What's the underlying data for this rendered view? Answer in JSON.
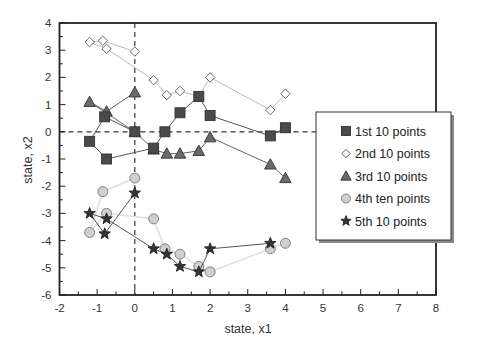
{
  "chart_data": {
    "type": "scatter",
    "title": "",
    "xlabel": "state, x1",
    "ylabel": "state, x2",
    "xlim": [
      -2,
      8
    ],
    "ylim": [
      -6,
      4
    ],
    "xticks": [
      -2,
      -1,
      0,
      1,
      2,
      3,
      4,
      5,
      6,
      7,
      8
    ],
    "yticks": [
      -6,
      -5,
      -4,
      -3,
      -2,
      -1,
      0,
      1,
      2,
      3,
      4
    ],
    "grid": false,
    "reference_lines": {
      "x": 0,
      "y": 0,
      "style": "dashed"
    },
    "legend_position": "right-middle",
    "series": [
      {
        "name": "1st 10 points",
        "marker": "square",
        "color": "#4a4a4a",
        "line_color": "#555555",
        "points": [
          [
            0,
            0
          ],
          [
            -0.8,
            0.55
          ],
          [
            -1.2,
            -0.35
          ],
          [
            -0.75,
            -1.0
          ],
          [
            0.5,
            -0.6
          ],
          [
            0.8,
            0.0
          ],
          [
            1.2,
            0.7
          ],
          [
            1.7,
            1.3
          ],
          [
            2.0,
            0.6
          ],
          [
            3.6,
            -0.15
          ],
          [
            4.0,
            0.15
          ]
        ]
      },
      {
        "name": "2nd 10 points",
        "marker": "diamond",
        "color": "#ffffff",
        "line_color": "#bbbbbb",
        "points": [
          [
            0,
            2.95
          ],
          [
            -0.85,
            3.35
          ],
          [
            -1.2,
            3.3
          ],
          [
            -0.75,
            3.05
          ],
          [
            0.5,
            1.9
          ],
          [
            0.85,
            1.35
          ],
          [
            1.2,
            1.5
          ],
          [
            1.7,
            1.3
          ],
          [
            2.0,
            2.0
          ],
          [
            3.6,
            0.8
          ],
          [
            4.0,
            1.4
          ]
        ]
      },
      {
        "name": "3rd 10 points",
        "marker": "triangle",
        "color": "#6a6a6a",
        "line_color": "#666666",
        "points": [
          [
            0,
            1.45
          ],
          [
            -0.75,
            0.75
          ],
          [
            -1.2,
            1.1
          ],
          [
            0,
            0
          ],
          [
            0.5,
            -0.65
          ],
          [
            0.85,
            -0.8
          ],
          [
            1.2,
            -0.8
          ],
          [
            1.7,
            -0.7
          ],
          [
            2.0,
            -0.2
          ],
          [
            3.6,
            -1.2
          ],
          [
            4.0,
            -1.7
          ]
        ]
      },
      {
        "name": "4th ten points",
        "marker": "circle",
        "color": "#d0d0d0",
        "line_color": "#e0e0e0",
        "points": [
          [
            0,
            -1.7
          ],
          [
            -0.85,
            -2.2
          ],
          [
            -1.2,
            -3.7
          ],
          [
            -0.75,
            -3.0
          ],
          [
            0.5,
            -3.2
          ],
          [
            0.8,
            -4.3
          ],
          [
            1.2,
            -4.5
          ],
          [
            1.7,
            -4.95
          ],
          [
            2.0,
            -5.15
          ],
          [
            3.6,
            -4.3
          ],
          [
            4.0,
            -4.1
          ]
        ]
      },
      {
        "name": "5th 10 points",
        "marker": "star",
        "color": "#333333",
        "line_color": "#555555",
        "points": [
          [
            0,
            -2.25
          ],
          [
            -0.8,
            -3.75
          ],
          [
            -1.2,
            -3.0
          ],
          [
            -0.75,
            -3.2
          ],
          [
            0.5,
            -4.3
          ],
          [
            0.85,
            -4.5
          ],
          [
            1.2,
            -4.95
          ],
          [
            1.7,
            -5.15
          ],
          [
            2.0,
            -4.3
          ],
          [
            3.6,
            -4.1
          ]
        ]
      }
    ]
  },
  "axes": {
    "xlabel": "state, x1",
    "ylabel": "state, x2",
    "xtick_labels": [
      "-2",
      "-1",
      "0",
      "1",
      "2",
      "3",
      "4",
      "5",
      "6",
      "7",
      "8"
    ],
    "ytick_labels": [
      "4",
      "3",
      "2",
      "1",
      "0",
      "-1",
      "-2",
      "-3",
      "-4",
      "-5",
      "-6"
    ]
  },
  "legend": {
    "items": [
      {
        "label": "1st 10 points",
        "marker": "square"
      },
      {
        "label": "2nd 10 points",
        "marker": "diamond"
      },
      {
        "label": "3rd 10 points",
        "marker": "triangle"
      },
      {
        "label": "4th ten points",
        "marker": "circle"
      },
      {
        "label": "5th 10 points",
        "marker": "star"
      }
    ]
  }
}
